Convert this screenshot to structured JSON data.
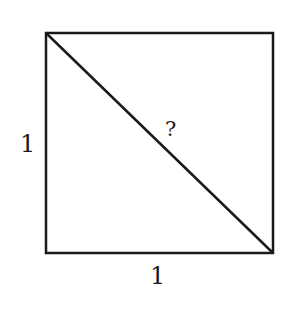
{
  "diagram": {
    "shape": "square",
    "side_left_label": "1",
    "side_bottom_label": "1",
    "diagonal_label": "?",
    "stroke_color": "#1a1a1a",
    "background": "#ffffff"
  }
}
